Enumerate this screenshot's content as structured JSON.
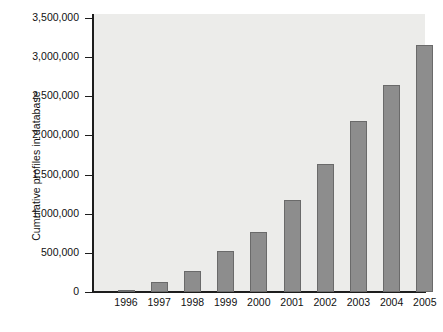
{
  "chart_data": {
    "type": "bar",
    "title": "",
    "subtitle": "",
    "xlabel": "",
    "ylabel": "Cumulative profiles in database",
    "categories": [
      "1996",
      "1997",
      "1998",
      "1999",
      "2000",
      "2001",
      "2002",
      "2003",
      "2004",
      "2005"
    ],
    "values": [
      30000,
      130000,
      270000,
      530000,
      770000,
      1180000,
      1640000,
      2180000,
      2650000,
      3160000
    ],
    "value_labels": [
      "30,000",
      "130,000",
      "270,000",
      "530,000",
      "770,000",
      "1,180,000",
      "1,640,000",
      "2,180,000",
      "2,650,000",
      "3,160,000"
    ],
    "series": [
      {
        "name": "Cumulative profiles in database",
        "values": [
          30000,
          130000,
          270000,
          530000,
          770000,
          1180000,
          1640000,
          2180000,
          2650000,
          3160000
        ]
      }
    ],
    "ylim": [
      0,
      3500000
    ],
    "xlim_categories": 10,
    "ytick_values": [
      0,
      500000,
      1000000,
      1500000,
      2000000,
      2500000,
      3000000,
      3500000
    ],
    "ytick_labels": [
      "0",
      "500,000",
      "1,000,000",
      "1,500,000",
      "2,000,000",
      "2,500,000",
      "3,000,000",
      "3,500,000"
    ],
    "grid": false,
    "legend": false,
    "legend_position": "none",
    "bar_color": "#8d8d8d",
    "bar_edge_color": "#6a6a6a",
    "plot_background_color": "#ececea",
    "figure_background_color": "#ffffff",
    "axis_color": "#1d1d1d",
    "text_color": "#111111"
  }
}
